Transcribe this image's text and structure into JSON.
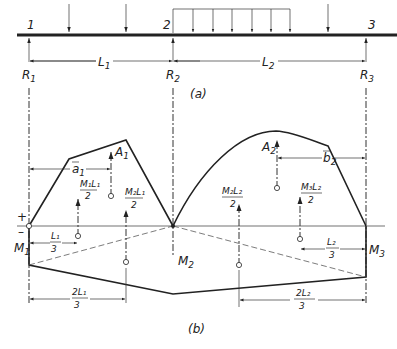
{
  "figure_a": {
    "caption": "(a)",
    "nodes": [
      "1",
      "2",
      "3"
    ],
    "reactions": [
      "R",
      "R",
      "R"
    ],
    "reaction_subs": [
      "1",
      "2",
      "3"
    ],
    "spans": [
      "L",
      "L"
    ],
    "span_subs": [
      "1",
      "2"
    ]
  },
  "figure_b": {
    "caption": "(b)",
    "plus": "+",
    "minus": "–",
    "moments": [
      "M",
      "M",
      "M"
    ],
    "moment_subs": [
      "1",
      "2",
      "3"
    ],
    "areas": {
      "a1": "A",
      "a1_sub": "1",
      "a2": "A",
      "a2_sub": "2"
    },
    "centroid_dims": {
      "a": "a",
      "a_sub": "1",
      "b": "b",
      "b_sub": "2"
    },
    "fractions": {
      "m1l1_num": "M₁L₁",
      "m1l1_den": "2",
      "m2l1_num": "M₂L₁",
      "m2l1_den": "2",
      "m2l2_num": "M₂L₂",
      "m2l2_den": "2",
      "m3l2_num": "M₃L₂",
      "m3l2_den": "2",
      "l1_3_num": "L₁",
      "l1_3_den": "3",
      "l2_3_num": "L₂",
      "l2_3_den": "3",
      "twol1_3_num": "2L₁",
      "twol1_3_den": "3",
      "twol2_3_num": "2L₂",
      "twol2_3_den": "3"
    }
  }
}
